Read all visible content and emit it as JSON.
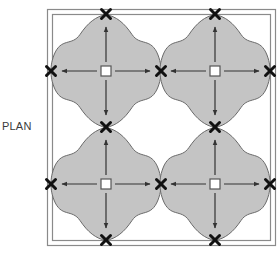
{
  "label": "PLAN",
  "colors": {
    "lobe_fill": "#c4c4c4",
    "lobe_stroke": "#6a6a6a",
    "frame": "#8a8a8a",
    "marker": "#111111",
    "arrow": "#333333",
    "center_square_fill": "#ffffff"
  },
  "grid": {
    "columns": [
      106,
      215
    ],
    "rows": [
      71,
      184
    ],
    "half_span": 55
  },
  "cells": [
    {
      "id": "top-left",
      "cx": 106,
      "cy": 71
    },
    {
      "id": "top-right",
      "cx": 215,
      "cy": 71
    },
    {
      "id": "bottom-left",
      "cx": 106,
      "cy": 184
    },
    {
      "id": "bottom-right",
      "cx": 215,
      "cy": 184
    }
  ],
  "markers": [
    [
      106,
      14
    ],
    [
      215,
      14
    ],
    [
      51,
      71
    ],
    [
      161,
      71
    ],
    [
      270,
      71
    ],
    [
      106,
      127
    ],
    [
      215,
      127
    ],
    [
      51,
      184
    ],
    [
      161,
      184
    ],
    [
      270,
      184
    ],
    [
      106,
      240
    ],
    [
      215,
      240
    ]
  ]
}
